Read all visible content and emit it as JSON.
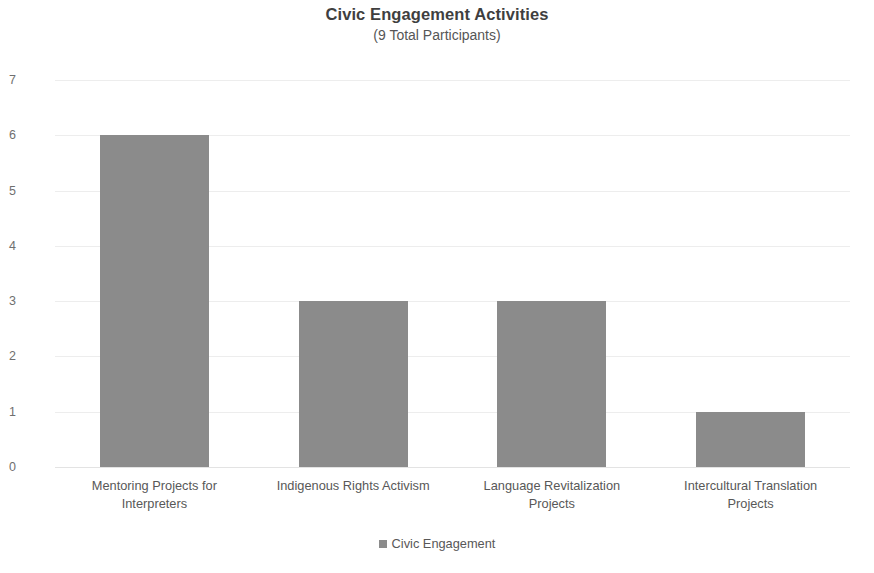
{
  "chart_data": {
    "type": "bar",
    "title": "Civic Engagement Activities",
    "subtitle": "(9 Total Participants)",
    "categories": [
      "Mentoring Projects for Interpreters",
      "Indigenous Rights Activism",
      "Language Revitalization Projects",
      "Intercultural Translation Projects"
    ],
    "category_lines": [
      [
        "Mentoring Projects for",
        "Interpreters"
      ],
      [
        "Indigenous Rights Activism",
        ""
      ],
      [
        "Language Revitalization",
        "Projects"
      ],
      [
        "Intercultural Translation",
        "Projects"
      ]
    ],
    "values": [
      6,
      3,
      3,
      1
    ],
    "series": [
      {
        "name": "Civic Engagement",
        "values": [
          6,
          3,
          3,
          1
        ]
      }
    ],
    "xlabel": "",
    "ylabel": "",
    "ylim": [
      0,
      7
    ],
    "ytick_labels": [
      "7",
      "6",
      "5",
      "4",
      "3",
      "2",
      "1",
      "0"
    ],
    "ytick_values": [
      7,
      6,
      5,
      4,
      3,
      2,
      1,
      0
    ],
    "grid": true,
    "grid_axis": "y",
    "legend_position": "bottom",
    "bar_color": "#8b8b8b",
    "grid_color": "#ededed",
    "title_color": "#3f3f3f",
    "tick_color": "#6f6f6f"
  },
  "legend": {
    "items": [
      {
        "label": "Civic Engagement",
        "color": "#8b8b8b",
        "marker": "square-marker"
      }
    ]
  }
}
